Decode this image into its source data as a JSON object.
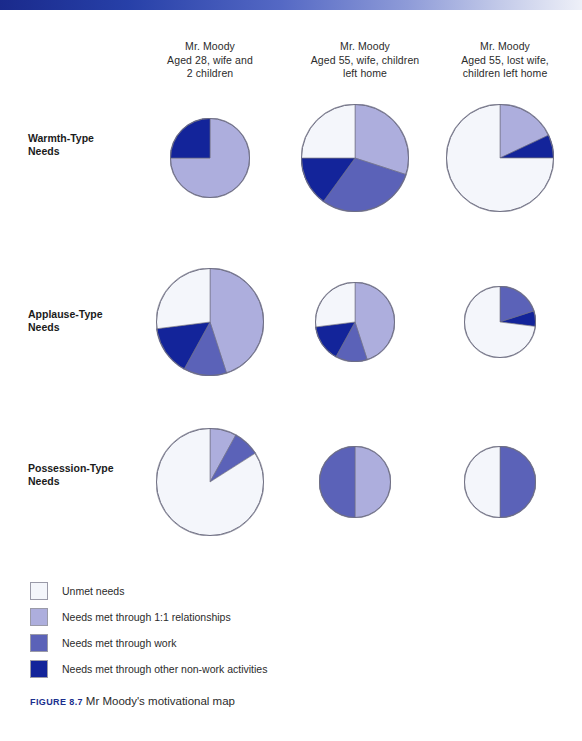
{
  "figure": {
    "caption_label": "FIGURE 8.7",
    "caption_text": "Mr Moody's motivational map"
  },
  "colors": {
    "unmet": "#f4f6fb",
    "one_to_one": "#adaedd",
    "work": "#5b62b8",
    "other_non_work": "#13249a",
    "outline": "#6f6f82",
    "top_bar_start": "#1a2a8c",
    "top_bar_end": "#eef0f8"
  },
  "columns": [
    {
      "line1": "Mr. Moody",
      "line2": "Aged 28, wife and",
      "line3": "2 children"
    },
    {
      "line1": "Mr. Moody",
      "line2": "Aged 55, wife, children",
      "line3": "left home"
    },
    {
      "line1": "Mr. Moody",
      "line2": "Aged 55, lost wife,",
      "line3": "children left home"
    }
  ],
  "rows": [
    {
      "line1": "Warmth-Type",
      "line2": "Needs"
    },
    {
      "line1": "Applause-Type",
      "line2": "Needs"
    },
    {
      "line1": "Possession-Type",
      "line2": "Needs"
    }
  ],
  "legend": [
    {
      "key": "unmet",
      "label": "Unmet needs"
    },
    {
      "key": "one_to_one",
      "label": "Needs met through 1:1 relationships"
    },
    {
      "key": "work",
      "label": "Needs met through work"
    },
    {
      "key": "other_non_work",
      "label": "Needs met through other non-work activities"
    }
  ],
  "chart_data": {
    "type": "pie",
    "title": "Mr Moody's motivational map",
    "legend_position": "bottom-left",
    "categories": [
      "Unmet needs",
      "Needs met through 1:1 relationships",
      "Needs met through work",
      "Needs met through other non-work activities"
    ],
    "category_colors": [
      "#f4f6fb",
      "#adaedd",
      "#5b62b8",
      "#13249a"
    ],
    "row_labels": [
      "Warmth-Type Needs",
      "Applause-Type Needs",
      "Possession-Type Needs"
    ],
    "column_labels": [
      "Mr. Moody Aged 28, wife and 2 children",
      "Mr. Moody Aged 55, wife, children left home",
      "Mr. Moody Aged 55, lost wife, children left home"
    ],
    "note": "values are percentages of each pie; radius is the relative pie size in px",
    "pies": [
      {
        "row": 0,
        "col": 0,
        "cx": 210,
        "cy": 148,
        "radius": 40,
        "values": {
          "unmet": 0,
          "one_to_one": 75,
          "work": 0,
          "other_non_work": 25
        }
      },
      {
        "row": 0,
        "col": 1,
        "cx": 355,
        "cy": 148,
        "radius": 54,
        "values": {
          "unmet": 25,
          "one_to_one": 30,
          "work": 30,
          "other_non_work": 15
        }
      },
      {
        "row": 0,
        "col": 2,
        "cx": 500,
        "cy": 148,
        "radius": 54,
        "values": {
          "unmet": 75,
          "one_to_one": 18,
          "work": 0,
          "other_non_work": 7
        }
      },
      {
        "row": 1,
        "col": 0,
        "cx": 210,
        "cy": 312,
        "radius": 54,
        "values": {
          "unmet": 27,
          "one_to_one": 45,
          "work": 13,
          "other_non_work": 15
        }
      },
      {
        "row": 1,
        "col": 1,
        "cx": 355,
        "cy": 312,
        "radius": 40,
        "values": {
          "unmet": 27,
          "one_to_one": 45,
          "work": 13,
          "other_non_work": 15
        }
      },
      {
        "row": 1,
        "col": 2,
        "cx": 500,
        "cy": 312,
        "radius": 36,
        "values": {
          "unmet": 73,
          "one_to_one": 0,
          "work": 20,
          "other_non_work": 7
        }
      },
      {
        "row": 2,
        "col": 0,
        "cx": 210,
        "cy": 472,
        "radius": 54,
        "values": {
          "unmet": 84,
          "one_to_one": 8,
          "work": 8,
          "other_non_work": 0
        }
      },
      {
        "row": 2,
        "col": 1,
        "cx": 355,
        "cy": 472,
        "radius": 36,
        "values": {
          "unmet": 0,
          "one_to_one": 50,
          "work": 50,
          "other_non_work": 0
        }
      },
      {
        "row": 2,
        "col": 2,
        "cx": 500,
        "cy": 472,
        "radius": 36,
        "values": {
          "unmet": 50,
          "one_to_one": 0,
          "work": 50,
          "other_non_work": 0
        }
      }
    ]
  }
}
